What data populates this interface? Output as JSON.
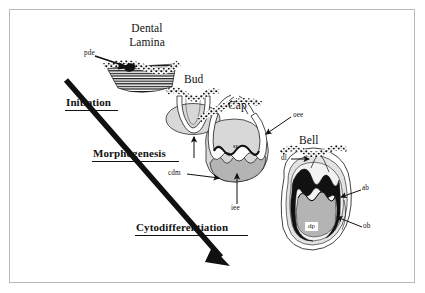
{
  "figure": {
    "type": "biological-schematic",
    "background_color": "#ffffff",
    "frame_color": "#b9b9b9"
  },
  "stages": [
    {
      "id": "dental-lamina",
      "label_line1": "Dental",
      "label_line2": "Lamina"
    },
    {
      "id": "bud",
      "label": "Bud"
    },
    {
      "id": "cap",
      "label": "Cap"
    },
    {
      "id": "bell",
      "label": "Bell"
    }
  ],
  "phases": [
    {
      "id": "initiation",
      "label": "Initiation"
    },
    {
      "id": "morphogenesis",
      "label": "Morphogenesis"
    },
    {
      "id": "cytodifferentiation",
      "label": "Cytodifferentiation"
    }
  ],
  "annotations": [
    {
      "id": "pde",
      "label": "pde",
      "stage": "dental-lamina",
      "description": "primary dental epithelium"
    },
    {
      "id": "cdm",
      "label": "cdm",
      "stage": "cap",
      "description": "condensed dental mesenchyme"
    },
    {
      "id": "oee",
      "label": "oee",
      "stage": "cap",
      "description": "outer enamel epithelium"
    },
    {
      "id": "iee",
      "label": "iee",
      "stage": "cap",
      "description": "inner enamel epithelium"
    },
    {
      "id": "sr-cap",
      "label": "sr",
      "stage": "cap",
      "description": "stellate reticulum"
    },
    {
      "id": "dl",
      "label": "dl",
      "stage": "bell",
      "description": "dental lamina"
    },
    {
      "id": "sr-bell",
      "label": "sr",
      "stage": "bell",
      "description": "stellate reticulum"
    },
    {
      "id": "ab",
      "label": "ab",
      "stage": "bell",
      "description": "ameloblasts"
    },
    {
      "id": "ob",
      "label": "ob",
      "stage": "bell",
      "description": "odontoblasts"
    },
    {
      "id": "dp",
      "label": "dp",
      "stage": "bell",
      "description": "dental papilla"
    }
  ],
  "timeline_arrow": {
    "id": "progression-arrow",
    "direction": "top-left to bottom-right",
    "color": "#111111"
  },
  "colors": {
    "mesenchyme_light": "#d8d8d8",
    "mesenchyme_mid": "#b4b4b4",
    "epithelium_fill": "#ffffff",
    "ink": "#111111",
    "enamel_organ_line": "#000000"
  }
}
